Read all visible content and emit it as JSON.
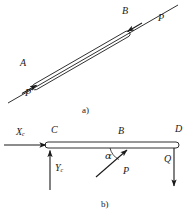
{
  "figure": {
    "title_visible": false,
    "background_color": "#ffffff",
    "stroke_color": "#1a1a1a",
    "panels": [
      {
        "id": "panel-a",
        "caption": "a)",
        "description": "Inclined two-force rod AB loaded by equal and opposite axial forces P at both ends (compression along the rod axis).",
        "labels": [
          {
            "name": "point-a-label",
            "text": "A",
            "x": 20,
            "y": 64
          },
          {
            "name": "point-b-label",
            "text": "B",
            "x": 122,
            "y": 12
          },
          {
            "name": "force-p-lower",
            "text": "P",
            "x": 26,
            "y": 94
          },
          {
            "name": "force-p-upper",
            "text": "P",
            "x": 160,
            "y": 16
          }
        ]
      },
      {
        "id": "panel-b",
        "caption": "b)",
        "description": "Horizontal bar CD free-body diagram: reaction components Xc and Yc at pin C, inclined force P applied at B at angle alpha to the bar, and vertical load Q at D.",
        "labels": [
          {
            "name": "reaction-x-label",
            "text": "X",
            "sub": "c",
            "x": 16,
            "y": 131
          },
          {
            "name": "reaction-y-label",
            "text": "Y",
            "sub": "c",
            "x": 54,
            "y": 167
          },
          {
            "name": "point-c-label",
            "text": "C",
            "x": 52,
            "y": 129
          },
          {
            "name": "point-b-label-b",
            "text": "B",
            "x": 119,
            "y": 130
          },
          {
            "name": "point-d-label",
            "text": "D",
            "x": 175,
            "y": 128
          },
          {
            "name": "angle-alpha-label",
            "text": "α",
            "x": 106,
            "y": 155
          },
          {
            "name": "force-p-label-b",
            "text": "P",
            "x": 124,
            "y": 170
          },
          {
            "name": "force-q-label",
            "text": "Q",
            "x": 165,
            "y": 158
          }
        ]
      }
    ],
    "captions": [
      {
        "name": "caption-a",
        "text": "a)",
        "x": 82,
        "y": 108
      },
      {
        "name": "caption-b",
        "text": "b)",
        "x": 101,
        "y": 202
      }
    ]
  }
}
